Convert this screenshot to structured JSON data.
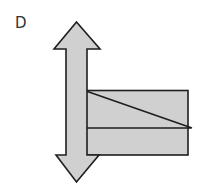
{
  "figure": {
    "label": "D",
    "colors": {
      "fill": "#d0d0d0",
      "stroke": "#1e1e1e",
      "background": "#ffffff",
      "label": "#333333"
    }
  }
}
